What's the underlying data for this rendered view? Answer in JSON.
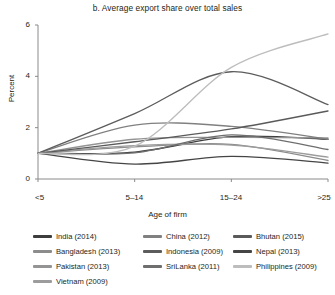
{
  "chart_data": {
    "type": "line",
    "title": "b. Average export share over total sales",
    "xlabel": "Age of firm",
    "ylabel": "Percent",
    "categories": [
      "<5",
      "5–14",
      "15–24",
      ">25"
    ],
    "x": [
      0,
      1,
      2,
      3
    ],
    "ylim": [
      0,
      6
    ],
    "yticks": [
      0,
      2,
      4,
      6
    ],
    "ytick_labels": [
      "0",
      "2",
      "4",
      "6"
    ],
    "grid": false,
    "legend_position": "bottom",
    "legend_columns": 3,
    "series": [
      {
        "name": "India (2014)",
        "label": "India (2014)",
        "color": "#3d3d3d",
        "values": [
          1.0,
          1.05,
          1.65,
          1.55
        ]
      },
      {
        "name": "Bangladesh (2013)",
        "label": "Bangladesh (2013)",
        "color": "#8c8c8c",
        "values": [
          1.0,
          1.25,
          1.35,
          0.72
        ]
      },
      {
        "name": "Pakistan (2013)",
        "label": "Pakistan (2013)",
        "color": "#949494",
        "values": [
          1.0,
          1.55,
          1.62,
          1.6
        ]
      },
      {
        "name": "Vietnam (2009)",
        "label": "Vietnam (2009)",
        "color": "#9c9c9c",
        "values": [
          1.0,
          1.3,
          1.32,
          0.85
        ]
      },
      {
        "name": "China (2012)",
        "label": "China (2012)",
        "color": "#808080",
        "values": [
          1.0,
          2.1,
          2.05,
          1.55
        ]
      },
      {
        "name": "Indonesia (2009)",
        "label": "Indonesia (2009)",
        "color": "#5c5c5c",
        "values": [
          1.0,
          2.55,
          4.18,
          2.9
        ]
      },
      {
        "name": "SriLanka (2011)",
        "label": "SriLanka (2011)",
        "color": "#6e6e6e",
        "values": [
          1.0,
          1.02,
          1.72,
          1.15
        ]
      },
      {
        "name": "Bhutan (2015)",
        "label": "Bhutan (2015)",
        "color": "#5a5a5a",
        "values": [
          1.0,
          1.45,
          1.95,
          2.65
        ]
      },
      {
        "name": "Nepal (2013)",
        "label": "Nepal (2013)",
        "color": "#454545",
        "values": [
          1.0,
          0.58,
          0.88,
          0.62
        ]
      },
      {
        "name": "Philippines (2009)",
        "label": "Philippines (2009)",
        "color": "#bdbdbd",
        "values": [
          1.0,
          1.28,
          4.35,
          5.65
        ]
      }
    ]
  }
}
